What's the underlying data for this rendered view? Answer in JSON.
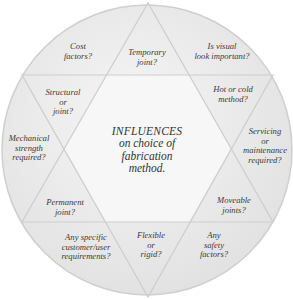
{
  "diagram": {
    "center": {
      "title": "INFLUENCES",
      "lines": [
        "on choice of",
        "fabrication",
        "method."
      ]
    },
    "segments": [
      {
        "id": "cost",
        "lines": [
          "Cost",
          "factors?"
        ]
      },
      {
        "id": "temporary",
        "lines": [
          "Temporary",
          "joint?"
        ]
      },
      {
        "id": "visual",
        "lines": [
          "Is visual",
          "look important?"
        ]
      },
      {
        "id": "structural",
        "lines": [
          "Structural",
          "or",
          "joint?"
        ]
      },
      {
        "id": "hot-cold",
        "lines": [
          "Hot or cold",
          "method?"
        ]
      },
      {
        "id": "mechanical",
        "lines": [
          "Mechanical",
          "strength",
          "required?"
        ]
      },
      {
        "id": "servicing",
        "lines": [
          "Servicing",
          "or",
          "maintenance",
          "required?"
        ]
      },
      {
        "id": "permanent",
        "lines": [
          "Permanent",
          "joint?"
        ]
      },
      {
        "id": "moveable",
        "lines": [
          "Moveable",
          "joints?"
        ]
      },
      {
        "id": "customer",
        "lines": [
          "Any specific",
          "customer/user",
          "requirements?"
        ]
      },
      {
        "id": "flexible",
        "lines": [
          "Flexible",
          "or",
          "rigid?"
        ]
      },
      {
        "id": "safety",
        "lines": [
          "Any",
          "safety",
          "factors?"
        ]
      }
    ],
    "colors": {
      "circle_fill": "#e9e9e9",
      "circle_edge": "#cfcfcf",
      "line": "#c8c8c8",
      "text": "#3a3a3a"
    }
  }
}
